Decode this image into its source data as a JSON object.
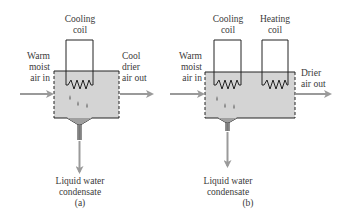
{
  "diagram_a": {
    "coil_label_1": "Cooling",
    "coil_label_2": "coil",
    "inlet_1": "Warm",
    "inlet_2": "moist",
    "inlet_3": "air in",
    "outlet_1": "Cool",
    "outlet_2": "drier",
    "outlet_3": "air out",
    "drain_1": "Liquid water",
    "drain_2": "condensate",
    "caption": "(a)"
  },
  "diagram_b": {
    "cooling_label_1": "Cooling",
    "cooling_label_2": "coil",
    "heating_label_1": "Heating",
    "heating_label_2": "coil",
    "inlet_1": "Warm",
    "inlet_2": "moist",
    "inlet_3": "air in",
    "outlet_1": "Drier",
    "outlet_2": "air out",
    "drain_1": "Liquid water",
    "drain_2": "condensate",
    "caption": "(b)"
  },
  "colors": {
    "chamber_fill": "#d4d4d4",
    "arrow": "#9a9a9a",
    "outline": "#222222",
    "droplet": "#8a8a8a"
  }
}
